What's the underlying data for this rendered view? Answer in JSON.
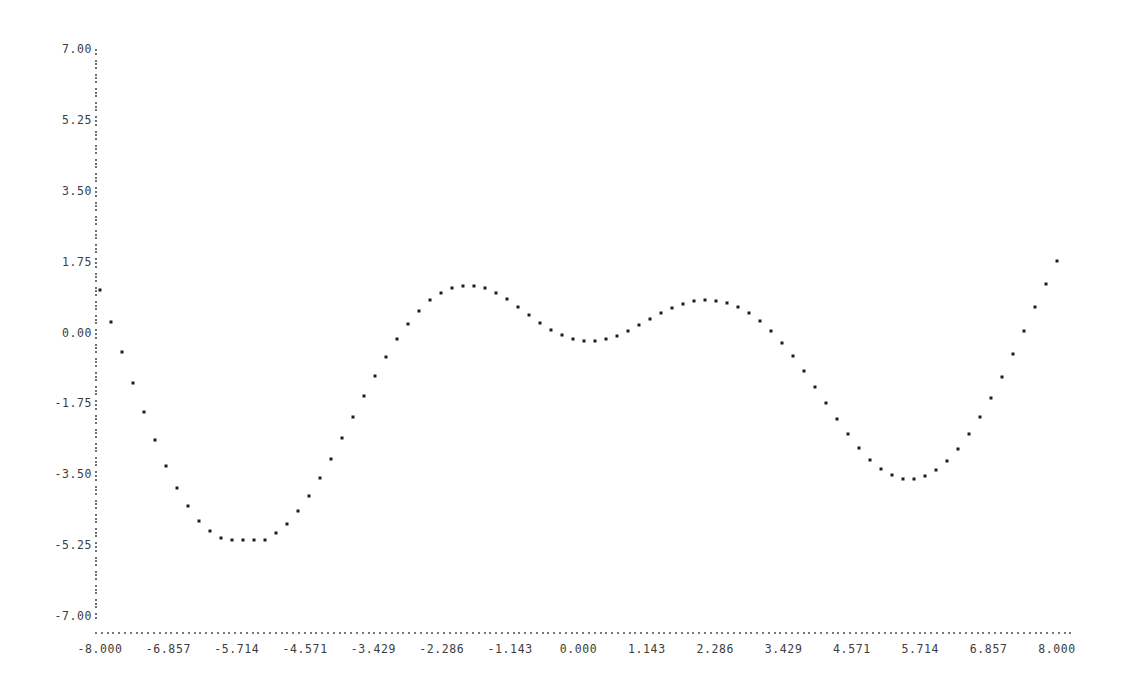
{
  "chart_data": {
    "type": "scatter",
    "title": "",
    "subtitle": "",
    "xlabel": "",
    "ylabel": "",
    "style": "ascii-terminal-plot",
    "marker": "*",
    "axis_marker": ".",
    "vaxis_marker": ":",
    "grid": false,
    "legend": null,
    "xlim": [
      -8.0,
      8.0
    ],
    "ylim": [
      -7.0,
      7.0
    ],
    "xticks": [
      -8.0,
      -6.857,
      -5.714,
      -4.571,
      -3.429,
      -2.286,
      -1.143,
      0.0,
      1.143,
      2.286,
      3.429,
      4.571,
      5.714,
      6.857,
      8.0
    ],
    "xtick_labels": [
      "-8.000",
      "-6.857",
      "-5.714",
      "-4.571",
      "-3.429",
      "-2.286",
      "-1.143",
      "0.000",
      "1.143",
      "2.286",
      "3.429",
      "4.571",
      "5.714",
      "6.857",
      "8.000"
    ],
    "yticks": [
      7.0,
      5.25,
      3.5,
      1.75,
      0.0,
      -1.75,
      -3.5,
      -5.25,
      -7.0
    ],
    "ytick_labels": [
      "7.00",
      "5.25",
      "3.50",
      "1.75",
      "0.00",
      "-1.75",
      "-3.50",
      "-5.25",
      "-7.00"
    ],
    "function": "x * sin(x)",
    "x": [
      -8.0,
      -7.84,
      -7.68,
      -7.52,
      -7.36,
      -7.2,
      -7.04,
      -6.88,
      -6.72,
      -6.56,
      -6.4,
      -6.24,
      -6.08,
      -5.92,
      -5.76,
      -5.6,
      -5.44,
      -5.28,
      -5.12,
      -4.96,
      -4.8,
      -4.64,
      -4.48,
      -4.32,
      -4.16,
      -4.0,
      -3.84,
      -3.68,
      -3.52,
      -3.36,
      -3.2,
      -3.04,
      -2.88,
      -2.72,
      -2.56,
      -2.4,
      -2.24,
      -2.08,
      -1.92,
      -1.76,
      -1.6,
      -1.44,
      -1.28,
      -1.12,
      -0.96,
      -0.8,
      -0.64,
      -0.48,
      -0.32,
      -0.16,
      0.0,
      0.16,
      0.32,
      0.48,
      0.64,
      0.8,
      0.96,
      1.12,
      1.28,
      1.44,
      1.6,
      1.76,
      1.92,
      2.08,
      2.24,
      2.4,
      2.56,
      2.72,
      2.88,
      3.04,
      3.2,
      3.36,
      3.52,
      3.68,
      3.84,
      4.0,
      4.16,
      4.32,
      4.48,
      4.64,
      4.8,
      4.96,
      5.12,
      5.28,
      5.44,
      5.6,
      5.76,
      5.92,
      6.08,
      6.24,
      6.4,
      6.56,
      6.72,
      6.88,
      7.04,
      7.2,
      7.36,
      7.52,
      7.68,
      7.84,
      8.0
    ],
    "y": [
      0.66,
      -0.786,
      -2.203,
      -3.551,
      -4.791,
      -5.887,
      -6.806,
      -7.519,
      -8.004,
      -8.242,
      -8.223,
      -7.943,
      -7.406,
      -6.624,
      -5.615,
      -4.405,
      -3.027,
      -1.519,
      0.074,
      1.704,
      3.321,
      4.876,
      6.321,
      7.612,
      8.707,
      9.571,
      10.174,
      10.492,
      10.511,
      10.222,
      9.63,
      8.748,
      7.599,
      6.215,
      4.638,
      2.918,
      1.107,
      -0.737,
      -2.555,
      -4.288,
      -5.879,
      -7.277,
      -8.436,
      -9.317,
      -9.89,
      -10.134,
      -10.039,
      -9.605,
      -8.841,
      -7.767,
      -6.413,
      -4.816,
      -3.024,
      -1.091,
      0.921,
      2.948,
      4.924,
      6.784,
      8.464,
      9.907,
      11.058,
      11.873,
      12.314,
      12.354,
      11.977,
      11.178,
      9.965,
      8.358,
      6.39,
      4.105,
      1.557,
      -1.188,
      -4.056,
      -6.969,
      -9.844,
      -12.597,
      -15.143,
      -17.402,
      -19.296,
      -20.757,
      -21.724,
      -22.147,
      -21.99,
      -21.231,
      -19.862,
      -17.892,
      -15.344,
      -12.258,
      -8.687,
      -4.7,
      -0.376,
      4.191,
      8.898,
      13.636,
      18.291,
      22.751,
      26.906,
      30.65,
      33.888,
      36.532,
      38.508
    ],
    "points_px": [
      [
        100,
        290
      ],
      [
        111,
        322
      ],
      [
        122,
        352
      ],
      [
        133,
        383
      ],
      [
        144,
        412
      ],
      [
        155,
        440
      ],
      [
        166,
        466
      ],
      [
        177,
        488
      ],
      [
        188,
        506
      ],
      [
        199,
        521
      ],
      [
        210,
        531
      ],
      [
        221,
        538
      ],
      [
        232,
        540
      ],
      [
        243,
        540
      ],
      [
        254,
        540
      ],
      [
        265,
        540
      ],
      [
        276,
        533
      ],
      [
        287,
        524
      ],
      [
        298,
        511
      ],
      [
        309,
        496
      ],
      [
        320,
        478
      ],
      [
        331,
        459
      ],
      [
        342,
        438
      ],
      [
        353,
        417
      ],
      [
        364,
        396
      ],
      [
        375,
        376
      ],
      [
        386,
        357
      ],
      [
        397,
        339
      ],
      [
        408,
        324
      ],
      [
        419,
        311
      ],
      [
        430,
        300
      ],
      [
        441,
        293
      ],
      [
        452,
        288
      ],
      [
        463,
        286
      ],
      [
        474,
        286
      ],
      [
        485,
        288
      ],
      [
        496,
        293
      ],
      [
        507,
        299
      ],
      [
        518,
        307
      ],
      [
        529,
        315
      ],
      [
        540,
        323
      ],
      [
        551,
        330
      ],
      [
        562,
        335
      ],
      [
        573,
        339
      ],
      [
        584,
        341
      ],
      [
        595,
        341
      ],
      [
        606,
        339
      ],
      [
        617,
        336
      ],
      [
        628,
        331
      ],
      [
        639,
        325
      ],
      [
        650,
        319
      ],
      [
        661,
        313
      ],
      [
        672,
        308
      ],
      [
        683,
        304
      ],
      [
        694,
        301
      ],
      [
        705,
        300
      ],
      [
        716,
        301
      ],
      [
        727,
        303
      ],
      [
        738,
        307
      ],
      [
        749,
        313
      ],
      [
        760,
        321
      ],
      [
        771,
        331
      ],
      [
        782,
        343
      ],
      [
        793,
        356
      ],
      [
        804,
        371
      ],
      [
        815,
        387
      ],
      [
        826,
        403
      ],
      [
        837,
        419
      ],
      [
        848,
        434
      ],
      [
        859,
        448
      ],
      [
        870,
        460
      ],
      [
        881,
        469
      ],
      [
        892,
        475
      ],
      [
        903,
        479
      ],
      [
        914,
        479
      ],
      [
        925,
        476
      ],
      [
        936,
        470
      ],
      [
        947,
        461
      ],
      [
        958,
        449
      ],
      [
        969,
        434
      ],
      [
        980,
        417
      ],
      [
        991,
        398
      ],
      [
        1002,
        377
      ],
      [
        1013,
        354
      ],
      [
        1024,
        331
      ],
      [
        1035,
        307
      ],
      [
        1046,
        284
      ],
      [
        1057,
        261
      ]
    ]
  }
}
